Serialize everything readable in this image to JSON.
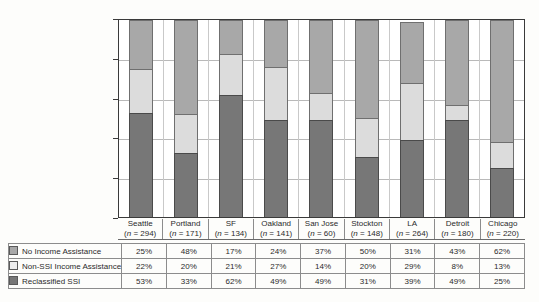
{
  "chart_data": {
    "type": "bar",
    "subtype": "stacked-100-percent",
    "title": "",
    "xlabel": "",
    "ylabel": "",
    "ylim": [
      0,
      100
    ],
    "yticks": [
      "0%",
      "20%",
      "40%",
      "60%",
      "80%",
      "100%"
    ],
    "ytick_values": [
      0,
      20,
      40,
      60,
      80,
      100
    ],
    "grid": true,
    "legend_position": "below-table-left",
    "categories": [
      "Seattle",
      "Portland",
      "SF",
      "Oakland",
      "San Jose",
      "Stockton",
      "LA",
      "Detroit",
      "Chicago"
    ],
    "category_n": [
      "(n = 294)",
      "(n = 171)",
      "(n = 134)",
      "(n = 141)",
      "(n = 60)",
      "(n = 148)",
      "(n = 264)",
      "(n = 180)",
      "(n = 220)"
    ],
    "series": [
      {
        "name": "No Income Assistance",
        "color": "#a8a8a8",
        "stack_position": "top",
        "values": [
          25,
          48,
          17,
          24,
          37,
          50,
          31,
          43,
          62
        ],
        "labels": [
          "25%",
          "48%",
          "17%",
          "24%",
          "37%",
          "50%",
          "31%",
          "43%",
          "62%"
        ]
      },
      {
        "name": "Non-SSI Income Assistance",
        "color": "#dcdcdc",
        "stack_position": "middle",
        "values": [
          22,
          20,
          21,
          27,
          14,
          20,
          29,
          8,
          13
        ],
        "labels": [
          "22%",
          "20%",
          "21%",
          "27%",
          "14%",
          "20%",
          "29%",
          "8%",
          "13%"
        ]
      },
      {
        "name": "Reclassified SSI",
        "color": "#777777",
        "stack_position": "bottom",
        "values": [
          53,
          33,
          62,
          49,
          49,
          31,
          39,
          49,
          25
        ],
        "labels": [
          "53%",
          "33%",
          "62%",
          "49%",
          "49%",
          "31%",
          "39%",
          "49%",
          "25%"
        ]
      }
    ]
  },
  "table": {
    "rows": [
      {
        "label": "No Income Assistance",
        "swatch": "legend-swatch-no-income-assistance",
        "values": [
          "25%",
          "48%",
          "17%",
          "24%",
          "37%",
          "50%",
          "31%",
          "43%",
          "62%"
        ]
      },
      {
        "label": "Non-SSI Income Assistance",
        "swatch": "legend-swatch-non-ssi-income-assistance",
        "values": [
          "22%",
          "20%",
          "21%",
          "27%",
          "14%",
          "20%",
          "29%",
          "8%",
          "13%"
        ]
      },
      {
        "label": "Reclassified SSI",
        "swatch": "legend-swatch-reclassified-ssi",
        "values": [
          "53%",
          "33%",
          "62%",
          "49%",
          "49%",
          "31%",
          "39%",
          "49%",
          "25%"
        ]
      }
    ]
  },
  "colors": {
    "no_income_assistance": "#a8a8a8",
    "non_ssi_income_assistance": "#dcdcdc",
    "reclassified_ssi": "#777777",
    "axis": "#3a3a3a",
    "grid": "#b9b9b9",
    "background": "#fdfdfb"
  }
}
